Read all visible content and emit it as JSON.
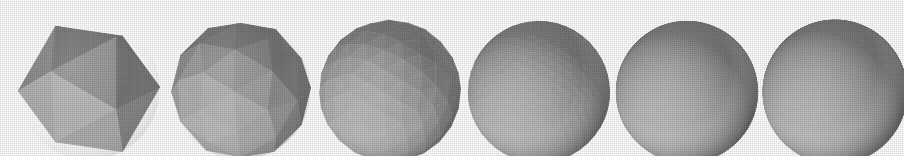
{
  "figure": {
    "background_color": "#ffffff",
    "width": 904,
    "height": 156,
    "shape_count": 6
  },
  "palette": {
    "background": "#ffffff",
    "face_lightest": "#b5b5b5",
    "face_light": "#a3a3a3",
    "face_mid": "#949494",
    "face_mid_dark": "#808080",
    "face_dark": "#5e5e5e",
    "face_darkest": "#3d3d3d",
    "edge": "#6e6e6e",
    "silhouette": "#6a6a6a"
  },
  "shapes": [
    {
      "index": 1,
      "name": "icosahedron-level-0",
      "label": "Icosahedron",
      "subdivision_level": 0,
      "face_count": 20,
      "silhouette": "hexagonal",
      "x": 14,
      "y": 11,
      "width": 122,
      "height": 134,
      "center_x": 75,
      "center_y": 78,
      "radius": 66,
      "smoothness": 0.0
    },
    {
      "index": 2,
      "name": "icosphere-level-1",
      "label": "Subdivision 1",
      "subdivision_level": 1,
      "face_count": 80,
      "silhouette": "decagonal",
      "x": 166,
      "y": 12,
      "width": 118,
      "height": 132,
      "center_x": 225,
      "center_y": 78,
      "radius": 64,
      "smoothness": 0.25
    },
    {
      "index": 3,
      "name": "icosphere-level-2",
      "label": "Subdivision 2",
      "subdivision_level": 2,
      "face_count": 320,
      "silhouette": "near-circular",
      "x": 315,
      "y": 13,
      "width": 118,
      "height": 130,
      "center_x": 374,
      "center_y": 78,
      "radius": 63,
      "smoothness": 0.55
    },
    {
      "index": 4,
      "name": "icosphere-level-3",
      "label": "Subdivision 3",
      "subdivision_level": 3,
      "face_count": 1280,
      "silhouette": "circular",
      "x": 464,
      "y": 14,
      "width": 116,
      "height": 128,
      "center_x": 522,
      "center_y": 78,
      "radius": 62,
      "smoothness": 0.8
    },
    {
      "index": 5,
      "name": "icosphere-level-4",
      "label": "Subdivision 4",
      "subdivision_level": 4,
      "face_count": 5120,
      "silhouette": "circular",
      "x": 612,
      "y": 14,
      "width": 116,
      "height": 128,
      "center_x": 670,
      "center_y": 78,
      "radius": 62,
      "smoothness": 0.93
    },
    {
      "index": 6,
      "name": "icosphere-level-5",
      "label": "Subdivision 5",
      "subdivision_level": 5,
      "face_count": 20480,
      "silhouette": "circular",
      "x": 760,
      "y": 14,
      "width": 118,
      "height": 128,
      "center_x": 819,
      "center_y": 78,
      "radius": 63,
      "smoothness": 1.0
    }
  ],
  "shading": {
    "model": "flat-faceted-lambert",
    "light_direction": "upper-left",
    "highlight_x_offset": -0.3,
    "highlight_y_offset": -0.35,
    "ambient": 0.42
  }
}
